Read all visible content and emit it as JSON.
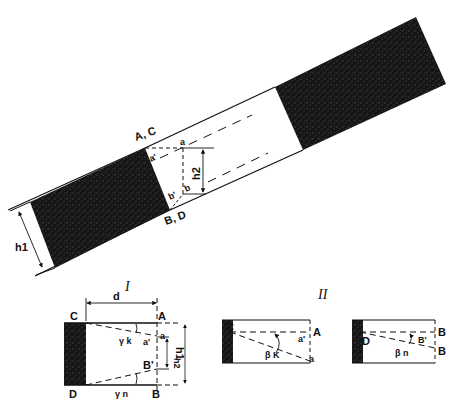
{
  "figure": {
    "main_view": {
      "labels": {
        "top_corner": "A, C",
        "bottom_corner": "B, D",
        "point_a": "a",
        "point_a_prime": "a'",
        "point_b": "b",
        "point_b_prime": "b'",
        "height_outer": "h1",
        "height_inner": "h2"
      }
    },
    "view_I": {
      "title": "I",
      "labels": {
        "C": "C",
        "A": "A",
        "D": "D",
        "B": "B",
        "a": "a",
        "a_prime": "a'",
        "B_prime": "B'",
        "distance": "d",
        "gamma_k": "γ k",
        "gamma_n": "γ n",
        "h1": "h1",
        "h2": "h2"
      }
    },
    "view_II": {
      "title": "II",
      "left": {
        "labels": {
          "C": "C",
          "A": "A",
          "a": "a",
          "a_prime": "a'",
          "beta_k": "β K"
        }
      },
      "right": {
        "labels": {
          "D": "D",
          "B_top": "B",
          "B_bottom": "B",
          "B_prime": "B'",
          "beta_n": "β n"
        }
      }
    },
    "colors": {
      "ink": "#111111",
      "fill_dark": "#151515",
      "background": "#ffffff"
    }
  }
}
